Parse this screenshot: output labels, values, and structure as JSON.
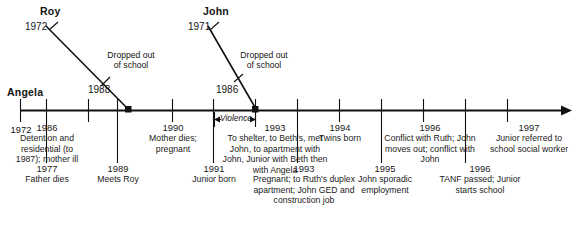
{
  "figure": {
    "type": "timeline",
    "axis": {
      "start_year": "1972",
      "end_year": "1997",
      "has_arrowhead": true,
      "direction": "left-to-right"
    },
    "persons": [
      {
        "name": "Angela",
        "kind": "main-timeline-label",
        "first_year": "1972"
      },
      {
        "name": "Roy",
        "kind": "branch",
        "birth_year": "1972",
        "join_year": "1988",
        "annotation": "Dropped out\nof school"
      },
      {
        "name": "John",
        "kind": "branch",
        "birth_year": "1971",
        "join_year": "1986",
        "annotation": "Dropped out\nof school"
      }
    ],
    "span_label": "Violence",
    "axis_labels": [
      {
        "year": "1972",
        "text": ""
      }
    ],
    "events_above": [
      {
        "year": "1986",
        "text": "Detention and\nresidential\n(to 1987);\nmother ill"
      },
      {
        "year": "1990",
        "text": "Mother dies;\npregnant"
      },
      {
        "year": "1993",
        "text": "To shelter, to Beth's,\nmet John, to apartment\nwith John, Junior with\nBeth then with Angela"
      },
      {
        "year": "1994",
        "text": "Twins born"
      },
      {
        "year": "1996",
        "text": "Conflict with Ruth;\nJohn moves out;\nconflict with John"
      },
      {
        "year": "1997",
        "text": "Junior referred\nto school\nsocial worker"
      }
    ],
    "events_below": [
      {
        "year": "1977",
        "text": "Father\ndies"
      },
      {
        "year": "1989",
        "text": "Meets\nRoy"
      },
      {
        "year": "1991",
        "text": "Junior\nborn"
      },
      {
        "year": "1993",
        "text": "Pregnant; to Ruth's duplex\napartment; John GED\nand construction job"
      },
      {
        "year": "1995",
        "text": "John sporadic\nemployment"
      },
      {
        "year": "1996",
        "text": "TANF passed;\nJunior starts school"
      }
    ],
    "colors": {
      "line": "#111111",
      "text": "#141414",
      "background": "#ffffff"
    }
  }
}
